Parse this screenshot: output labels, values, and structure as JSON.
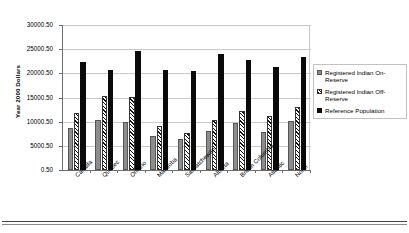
{
  "chart_data": {
    "type": "bar",
    "title": "",
    "xlabel": "",
    "ylabel": "Year 2000 Dollars",
    "ylim": [
      0.5,
      30000.5
    ],
    "ytick_values": [
      0.5,
      5000.5,
      10000.5,
      15000.5,
      20000.5,
      25000.5,
      30000.5
    ],
    "ytick_labels": [
      "0.50",
      "5000.50",
      "10000.50",
      "15000.50",
      "20000.50",
      "25000.50",
      "30000.50"
    ],
    "grid": true,
    "legend_position": "right",
    "categories": [
      "Canada",
      "Québec",
      "Ontario",
      "Manitoba",
      "Saskatchewan",
      "Alberta",
      "British Columbia",
      "Atlantic",
      "North"
    ],
    "series": [
      {
        "name": "Registered Indian On-Reserve",
        "color": "#8d8d8d",
        "fill": "solid-gray",
        "values": [
          8700,
          10400,
          10000,
          7000,
          6400,
          8000,
          9800,
          7900,
          10200
        ]
      },
      {
        "name": "Registered Indian Off-Reserve",
        "color": "#111111",
        "fill": "diagonal-hatch",
        "values": [
          11800,
          15300,
          15100,
          9200,
          7700,
          10400,
          12300,
          11200,
          13000
        ]
      },
      {
        "name": "Reference Population",
        "color": "#0a0a0a",
        "fill": "solid-black",
        "values": [
          22400,
          20600,
          24600,
          20700,
          20400,
          24000,
          22700,
          21400,
          23400
        ]
      }
    ]
  },
  "legend": {
    "items": [
      "Registered Indian On-Reserve",
      "Registered Indian Off-Reserve",
      "Reference Population"
    ]
  }
}
